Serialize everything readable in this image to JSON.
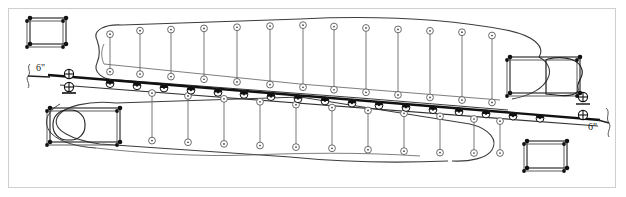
{
  "drawing": {
    "title": "Irrigation System Layout Plan",
    "sheet_bg": "#ffffff",
    "frame_color": "#cfcfcf",
    "line_color": "#1a1a1a",
    "field_outline_color": "#404040",
    "lateral_color": "#555555"
  },
  "labels": [
    {
      "name": "mainline-size-left",
      "text": "6\"",
      "x": 36,
      "y": 70
    },
    {
      "name": "mainline-size-right",
      "text": "6\"",
      "x": 592,
      "y": 128
    }
  ],
  "symbols": {
    "sprinkler": "sprinkler-head-circle",
    "riser": "riser-half-filled-circle",
    "valve": "gate-valve-crossed-circle",
    "corner": "corner-node-dot",
    "structure": "rectangular-pad"
  },
  "geometry": {
    "mainline": {
      "x1": 52,
      "y1": 76,
      "x2": 598,
      "y2": 120,
      "width": 2.2
    },
    "secondary_line": {
      "x1": 62,
      "y1": 84,
      "x2": 596,
      "y2": 124,
      "width": 1.1
    },
    "valves": [
      {
        "name": "valve-left",
        "cx": 69,
        "cy": 78
      },
      {
        "name": "valve-right",
        "cx": 581,
        "cy": 117
      }
    ],
    "upper_field": "M 97,40 C 92,30 105,24 120,26 L 300,20 C 380,16 450,20 505,30 C 530,34 545,45 540,56 L 120,80 C 100,82 92,70 97,62 C 99,55 99,47 97,40 Z",
    "lower_field": "M 58,122 C 48,112 58,104 76,103 L 300,98 L 480,122 C 500,128 502,142 492,152 C 482,162 466,164 452,162 L 120,152 C 92,150 52,142 58,122 Z",
    "pads": [
      {
        "name": "pad-upper-left",
        "x": 30,
        "y": 18,
        "w": 36,
        "h": 26
      },
      {
        "name": "pad-lower-left",
        "x": 50,
        "y": 108,
        "w": 70,
        "h": 34
      },
      {
        "name": "pad-upper-right",
        "x": 510,
        "y": 57,
        "w": 70,
        "h": 36
      },
      {
        "name": "pad-lower-right",
        "x": 527,
        "y": 141,
        "w": 40,
        "h": 27
      }
    ],
    "upper_laterals_x": [
      110,
      140,
      171,
      204,
      237,
      270,
      303,
      334,
      366,
      398,
      430,
      462,
      492
    ],
    "lower_laterals_x": [
      152,
      188,
      224,
      260,
      296,
      332,
      368,
      404,
      440,
      474,
      500
    ],
    "riser_count": 17,
    "upper_sprinkler_count": 26,
    "lower_sprinkler_count": 22
  }
}
